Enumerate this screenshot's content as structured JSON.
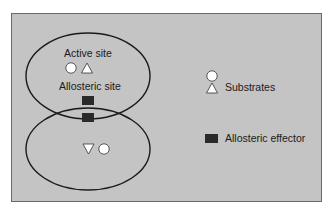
{
  "diagram": {
    "type": "allosteric-enzyme",
    "top_subunit": {
      "active_site_label": "Active site",
      "allosteric_site_label": "Allosteric site"
    },
    "legend": {
      "substrates_label": "Substrates",
      "effector_label": "Allosteric effector"
    },
    "colors": {
      "panel": "#c4c4c4",
      "outline": "#1a1a1a",
      "effector": "#2a2a2a",
      "substrate_fill": "#ffffff"
    }
  }
}
